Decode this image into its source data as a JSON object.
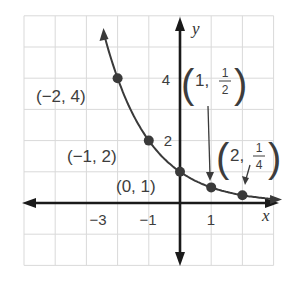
{
  "chart_data": {
    "type": "line",
    "title": "",
    "function": "y = (1/2)^x",
    "xlabel": "x",
    "ylabel": "y",
    "xlim": [
      -5,
      3
    ],
    "ylim": [
      -2,
      6
    ],
    "grid": true,
    "x_tick_labels": [
      {
        "value": -3,
        "label": "−3"
      },
      {
        "value": -1,
        "label": "−1"
      },
      {
        "value": 1,
        "label": "1"
      }
    ],
    "y_tick_labels": [
      {
        "value": 2,
        "label": "2"
      },
      {
        "value": 4,
        "label": "4"
      }
    ],
    "series": [
      {
        "name": "exponential curve",
        "x": [
          -2.4,
          -2,
          -1,
          0,
          1,
          2,
          3
        ],
        "y": [
          5.28,
          4,
          2,
          1,
          0.5,
          0.25,
          0.125
        ]
      }
    ],
    "points": [
      {
        "x": -2,
        "y": 4,
        "label": "(−2, 4)"
      },
      {
        "x": -1,
        "y": 2,
        "label": "(−1, 2)"
      },
      {
        "x": 0,
        "y": 1,
        "label": "(0, 1)"
      },
      {
        "x": 1,
        "y": 0.5,
        "label_main": "1,",
        "label_num": "1",
        "label_den": "2"
      },
      {
        "x": 2,
        "y": 0.25,
        "label_main": "2,",
        "label_num": "1",
        "label_den": "4"
      }
    ]
  }
}
